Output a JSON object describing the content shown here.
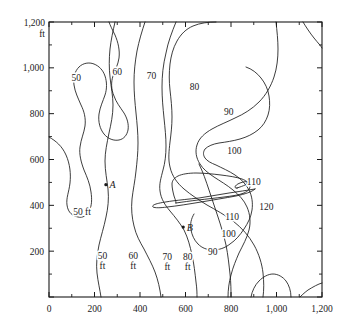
{
  "chart_data": {
    "type": "contour",
    "title": "",
    "xlabel": "",
    "ylabel": "",
    "xlim": [
      0,
      1200
    ],
    "ylim": [
      0,
      1200
    ],
    "x_unit": "ft",
    "y_unit": "ft",
    "grid": false,
    "legend": "none",
    "x_ticks": [
      0,
      200,
      400,
      600,
      800,
      1000,
      1200
    ],
    "y_ticks": [
      0,
      200,
      400,
      600,
      800,
      1000,
      1200
    ],
    "x_tick_labels": [
      "0",
      "200",
      "400",
      "600",
      "800",
      "1,000",
      "1,200"
    ],
    "y_tick_labels": [
      "",
      "200",
      "400",
      "600",
      "800",
      "1,000",
      "1,200"
    ],
    "y_minor_step": 100,
    "x_minor_step": 100,
    "contour_levels": [
      50,
      60,
      70,
      80,
      90,
      100,
      110,
      120
    ],
    "contour_interval": 10,
    "peak_value": 120,
    "peak_location": [
      880,
      400
    ],
    "labels": [
      {
        "text": "50",
        "x": 120,
        "y": 960
      },
      {
        "text": "60",
        "x": 300,
        "y": 985
      },
      {
        "text": "70",
        "x": 450,
        "y": 965
      },
      {
        "text": "80",
        "x": 640,
        "y": 920
      },
      {
        "text": "90",
        "x": 790,
        "y": 810
      },
      {
        "text": "100",
        "x": 815,
        "y": 640
      },
      {
        "text": "110",
        "x": 900,
        "y": 505
      },
      {
        "text": "120",
        "x": 955,
        "y": 395
      },
      {
        "text": "110",
        "x": 805,
        "y": 350
      },
      {
        "text": "100",
        "x": 790,
        "y": 278
      },
      {
        "text": "90",
        "x": 720,
        "y": 200
      },
      {
        "text": "50 ft",
        "x": 145,
        "y": 375
      },
      {
        "text": "50 ft",
        "x": 235,
        "y": 160
      },
      {
        "text": "60 ft",
        "x": 370,
        "y": 158
      },
      {
        "text": "70 ft",
        "x": 520,
        "y": 155
      },
      {
        "text": "80 ft",
        "x": 610,
        "y": 157
      }
    ],
    "points": [
      {
        "name": "A",
        "x": 250,
        "y": 490
      },
      {
        "name": "B",
        "x": 590,
        "y": 305
      }
    ],
    "axis_corner_label": {
      "line1": "1,200",
      "line2": "ft"
    }
  },
  "figure": {
    "background_color": "#ffffff",
    "line_color": "#1a1a1a"
  }
}
